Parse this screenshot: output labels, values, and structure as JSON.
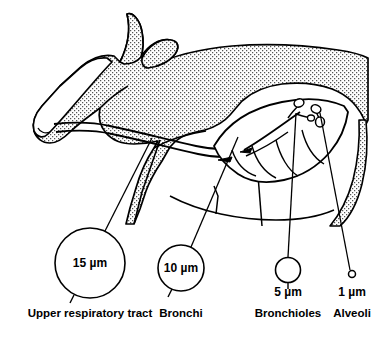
{
  "figure": {
    "line_color": "#000000",
    "fill_color": "#ffffff",
    "stipple_color": "#4a4a4a",
    "background": "#ffffff"
  },
  "callouts": [
    {
      "id": "upper-respiratory-tract",
      "size_label": "15 µm",
      "region_label": "Upper respiratory tract",
      "circle": {
        "cx": 90,
        "cy": 263,
        "r": 35
      },
      "size_text_pos": {
        "x": 90,
        "y": 267
      },
      "region_text_pos": {
        "x": 90,
        "y": 317
      },
      "leader": {
        "x1": 105,
        "y1": 231,
        "x2": 152,
        "y2": 138
      },
      "tick": {
        "x1": 74,
        "y1": 295,
        "x2": 70,
        "y2": 303
      }
    },
    {
      "id": "bronchi",
      "size_label": "10 µm",
      "region_label": "Bronchi",
      "circle": {
        "cx": 181,
        "cy": 268,
        "r": 23
      },
      "size_text_pos": {
        "x": 181,
        "y": 272
      },
      "region_text_pos": {
        "x": 181,
        "y": 317
      },
      "leader": {
        "x1": 191,
        "y1": 247,
        "x2": 238,
        "y2": 137
      },
      "tick": {
        "x1": 172,
        "y1": 289,
        "x2": 168,
        "y2": 297
      }
    },
    {
      "id": "bronchioles",
      "size_label": "5 µm",
      "region_label": "Bronchioles",
      "circle": {
        "cx": 288,
        "cy": 270,
        "r": 12.5
      },
      "size_text_pos": {
        "x": 288,
        "y": 295
      },
      "region_text_pos": {
        "x": 288,
        "y": 317
      },
      "leader": {
        "x1": 288,
        "y1": 257,
        "x2": 296,
        "y2": 113
      },
      "tick": {
        "x1": 288,
        "y1": 283,
        "x2": 288,
        "y2": 289
      }
    },
    {
      "id": "alveoli",
      "size_label": "1 µm",
      "region_label": "Alveoli",
      "circle": {
        "cx": 352,
        "cy": 274,
        "r": 3.5
      },
      "size_text_pos": {
        "x": 352,
        "y": 295
      },
      "region_text_pos": {
        "x": 352,
        "y": 317
      },
      "leader": {
        "x1": 350,
        "y1": 270,
        "x2": 320,
        "y2": 113
      },
      "tick": null
    }
  ],
  "anatomy": {
    "body_label": "cow-body-outline",
    "head_label": "cow-head-outline",
    "horn_label": "cow-horn",
    "ear_label": "cow-ear",
    "muzzle_label": "cow-muzzle",
    "trachea_label": "trachea",
    "lung_label": "lung-outline",
    "bronchial_tree_label": "bronchial-tree"
  }
}
